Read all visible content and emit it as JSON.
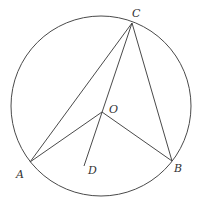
{
  "diagram": {
    "type": "circle-geometry",
    "circle": {
      "center_label": "O"
    },
    "points": [
      {
        "id": "A",
        "label": "A"
      },
      {
        "id": "B",
        "label": "B"
      },
      {
        "id": "C",
        "label": "C"
      },
      {
        "id": "O",
        "label": "O"
      },
      {
        "id": "D",
        "label": "D"
      }
    ],
    "segments": [
      "CA",
      "CB",
      "CD",
      "OA",
      "OB"
    ],
    "colors": {
      "stroke": "#4a4a4a",
      "label": "#333333",
      "background": "#ffffff"
    }
  }
}
